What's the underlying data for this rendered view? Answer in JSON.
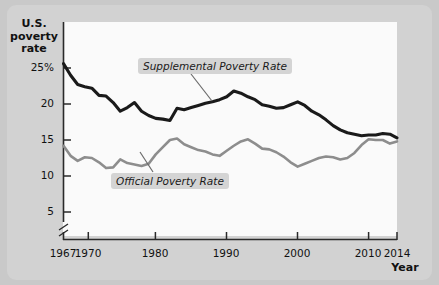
{
  "chart_data": {
    "type": "line",
    "title": "",
    "xlabel": "Year",
    "ylabel": "U.S. poverty rate",
    "ylabel_lines": [
      "U.S.",
      "poverty",
      "rate"
    ],
    "xlim": [
      1967,
      2014
    ],
    "ylim": [
      4,
      26.5
    ],
    "y_axis_break": true,
    "grid": false,
    "legend_position": "inline-annotations",
    "y_ticks": [
      {
        "value": 25,
        "label": "25%"
      },
      {
        "value": 20,
        "label": "20"
      },
      {
        "value": 15,
        "label": "15"
      },
      {
        "value": 10,
        "label": "10"
      },
      {
        "value": 5,
        "label": "5"
      }
    ],
    "x_ticks": [
      {
        "value": 1967,
        "label": "1967"
      },
      {
        "value": 1970,
        "label": "1970"
      },
      {
        "value": 1980,
        "label": "1980"
      },
      {
        "value": 1990,
        "label": "1990"
      },
      {
        "value": 2000,
        "label": "2000"
      },
      {
        "value": 2010,
        "label": "2010"
      },
      {
        "value": 2014,
        "label": "2014"
      }
    ],
    "x": [
      1967,
      1968,
      1969,
      1970,
      1971,
      1972,
      1973,
      1974,
      1975,
      1976,
      1977,
      1978,
      1979,
      1980,
      1981,
      1982,
      1983,
      1984,
      1985,
      1986,
      1987,
      1988,
      1989,
      1990,
      1991,
      1992,
      1993,
      1994,
      1995,
      1996,
      1997,
      1998,
      1999,
      2000,
      2001,
      2002,
      2003,
      2004,
      2005,
      2006,
      2007,
      2008,
      2009,
      2010,
      2011,
      2012,
      2013,
      2014
    ],
    "series": [
      {
        "name": "Supplemental Poverty Rate",
        "color": "#1a1a1a",
        "values": [
          25.6,
          24.0,
          22.7,
          22.4,
          22.2,
          21.2,
          21.1,
          20.2,
          19.0,
          19.5,
          20.2,
          19.0,
          18.4,
          18.0,
          17.9,
          17.7,
          19.4,
          19.2,
          19.5,
          19.8,
          20.1,
          20.3,
          20.6,
          21.0,
          21.8,
          21.5,
          21.0,
          20.6,
          19.9,
          19.7,
          19.4,
          19.5,
          19.9,
          20.3,
          19.8,
          19.0,
          18.5,
          17.8,
          17.0,
          16.4,
          16.0,
          15.8,
          15.6,
          15.7,
          15.7,
          15.9,
          15.8,
          15.3
        ]
      },
      {
        "name": "Official Poverty Rate",
        "color": "#8d8d8d",
        "values": [
          14.2,
          12.8,
          12.1,
          12.6,
          12.5,
          11.9,
          11.1,
          11.2,
          12.3,
          11.8,
          11.6,
          11.4,
          11.7,
          13.0,
          14.0,
          15.0,
          15.2,
          14.4,
          14.0,
          13.6,
          13.4,
          13.0,
          12.8,
          13.5,
          14.2,
          14.8,
          15.1,
          14.5,
          13.8,
          13.7,
          13.3,
          12.7,
          11.9,
          11.3,
          11.7,
          12.1,
          12.5,
          12.7,
          12.6,
          12.3,
          12.5,
          13.2,
          14.3,
          15.1,
          15.0,
          15.0,
          14.5,
          14.8
        ]
      }
    ],
    "annotations": [
      {
        "name": "supplemental-label",
        "text": "Supplemental Poverty Rate"
      },
      {
        "name": "official-label",
        "text": "Official Poverty Rate"
      }
    ]
  },
  "colors": {
    "figure_background": "#c9c9c9",
    "panel_background": "#fafafa",
    "supplemental_line": "#1a1a1a",
    "official_line": "#8d8d8d",
    "axis": "#2a2a2a",
    "label_badge": "#d4d4d4"
  }
}
